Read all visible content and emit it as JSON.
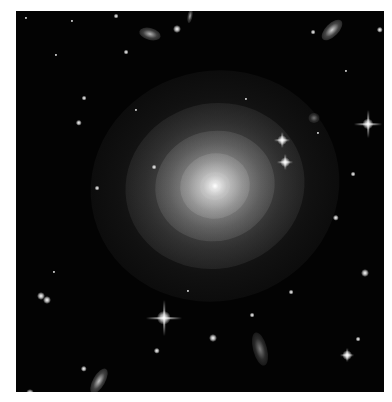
{
  "image": {
    "subject": "elliptical galaxy in star field",
    "background": "#030303",
    "border_color": "#ffffff",
    "core": {
      "x": 199,
      "y": 175,
      "color": "#f4f4f4"
    },
    "halo_layers": [
      {
        "w": 250,
        "h": 230,
        "opacity": 0.18
      },
      {
        "w": 180,
        "h": 165,
        "opacity": 0.32
      },
      {
        "w": 120,
        "h": 110,
        "opacity": 0.5
      },
      {
        "w": 70,
        "h": 65,
        "opacity": 0.7
      },
      {
        "w": 30,
        "h": 28,
        "opacity": 0.95
      }
    ],
    "spiked_stars": [
      {
        "x": 148,
        "y": 307,
        "size": 9,
        "spike": 36
      },
      {
        "x": 352,
        "y": 113,
        "size": 7,
        "spike": 28
      },
      {
        "x": 266,
        "y": 129,
        "size": 6,
        "spike": 16
      },
      {
        "x": 269,
        "y": 151,
        "size": 6,
        "spike": 16
      },
      {
        "x": 331,
        "y": 344,
        "size": 6,
        "spike": 14
      }
    ],
    "stars": [
      {
        "x": 100,
        "y": 5,
        "s": 3
      },
      {
        "x": 56,
        "y": 10,
        "s": 2
      },
      {
        "x": 161,
        "y": 18,
        "s": 5
      },
      {
        "x": 10,
        "y": 7,
        "s": 2
      },
      {
        "x": 110,
        "y": 41,
        "s": 3
      },
      {
        "x": 297,
        "y": 21,
        "s": 3
      },
      {
        "x": 364,
        "y": 19,
        "s": 4
      },
      {
        "x": 68,
        "y": 87,
        "s": 3
      },
      {
        "x": 63,
        "y": 112,
        "s": 4
      },
      {
        "x": 81,
        "y": 177,
        "s": 3
      },
      {
        "x": 138,
        "y": 156,
        "s": 3
      },
      {
        "x": 320,
        "y": 207,
        "s": 4
      },
      {
        "x": 349,
        "y": 262,
        "s": 5
      },
      {
        "x": 25,
        "y": 285,
        "s": 5
      },
      {
        "x": 31,
        "y": 289,
        "s": 5
      },
      {
        "x": 197,
        "y": 327,
        "s": 5
      },
      {
        "x": 141,
        "y": 340,
        "s": 4
      },
      {
        "x": 236,
        "y": 304,
        "s": 3
      },
      {
        "x": 68,
        "y": 358,
        "s": 4
      },
      {
        "x": 342,
        "y": 328,
        "s": 3
      },
      {
        "x": 275,
        "y": 281,
        "s": 3
      },
      {
        "x": 38,
        "y": 261,
        "s": 2
      },
      {
        "x": 14,
        "y": 382,
        "s": 5
      },
      {
        "x": 337,
        "y": 163,
        "s": 3
      },
      {
        "x": 230,
        "y": 88,
        "s": 2
      },
      {
        "x": 120,
        "y": 99,
        "s": 2
      },
      {
        "x": 302,
        "y": 122,
        "s": 2
      },
      {
        "x": 172,
        "y": 280,
        "s": 2
      },
      {
        "x": 40,
        "y": 44,
        "s": 2
      },
      {
        "x": 330,
        "y": 60,
        "s": 2
      }
    ],
    "galaxies": [
      {
        "x": 134,
        "y": 23,
        "w": 22,
        "h": 12,
        "rot": 15,
        "opacity": 0.75
      },
      {
        "x": 316,
        "y": 19,
        "w": 26,
        "h": 13,
        "rot": -45,
        "opacity": 0.85
      },
      {
        "x": 83,
        "y": 370,
        "w": 28,
        "h": 12,
        "rot": -60,
        "opacity": 0.8
      },
      {
        "x": 244,
        "y": 338,
        "w": 34,
        "h": 14,
        "rot": 75,
        "opacity": 0.5
      },
      {
        "x": 298,
        "y": 107,
        "w": 11,
        "h": 10,
        "rot": 0,
        "opacity": 0.45
      },
      {
        "x": 174,
        "y": 5,
        "w": 5,
        "h": 14,
        "rot": 10,
        "opacity": 0.7
      }
    ]
  }
}
